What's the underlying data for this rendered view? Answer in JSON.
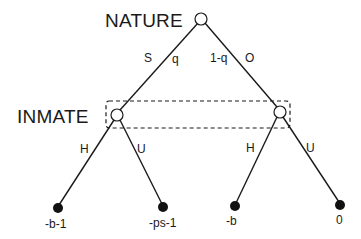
{
  "diagram": {
    "type": "extensive-form game tree",
    "players": {
      "nature": "NATURE",
      "inmate": "INMATE"
    },
    "nature_moves": {
      "left": {
        "action": "S",
        "probability": "q"
      },
      "right": {
        "action": "O",
        "probability": "1-q"
      }
    },
    "inmate_moves": {
      "left_node": {
        "left": "H",
        "right": "U"
      },
      "right_node": {
        "left": "H",
        "right": "U"
      }
    },
    "payoffs": [
      "-b-1",
      "-ps-1",
      "-b",
      "0"
    ],
    "information_set": "dashed box linking both INMATE nodes",
    "colors": {
      "line": "#1a1a1a",
      "terminal_node": "#111111",
      "decision_node_fill": "#ffffff",
      "background": "#ffffff"
    }
  }
}
